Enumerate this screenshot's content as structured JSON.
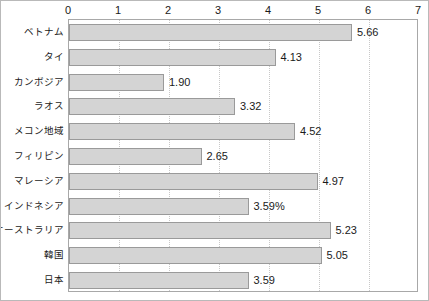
{
  "chart_data": {
    "type": "bar",
    "orientation": "horizontal",
    "title": "",
    "subtitle": "",
    "xlabel": "",
    "ylabel": "",
    "xlim": [
      0,
      7
    ],
    "xticks": [
      "0",
      "1",
      "2",
      "3",
      "4",
      "5",
      "6",
      "7"
    ],
    "grid": true,
    "legend": null,
    "categories": [
      "ベトナム",
      "タイ",
      "カンボジア",
      "ラオス",
      "メコン地域",
      "フィリピン",
      "マレーシア",
      "インドネシア",
      "オーストラリア",
      "韓国",
      "日本"
    ],
    "values": [
      5.66,
      4.13,
      1.9,
      3.32,
      4.52,
      2.65,
      4.97,
      3.59,
      5.23,
      5.05,
      3.59
    ],
    "value_labels": [
      "5.66",
      "4.13",
      "1.90",
      "3.32",
      "4.52",
      "2.65",
      "4.97",
      "3.59%",
      "5.23",
      "5.05",
      "3.59"
    ],
    "colors": {
      "bar_fill": "#d4d4d4",
      "bar_border": "#9a9a9a",
      "grid": "#c8c8c8",
      "plot_border": "#a8a8a8",
      "outer_border": "#b9b9b9",
      "text": "#1a1a1a"
    }
  }
}
